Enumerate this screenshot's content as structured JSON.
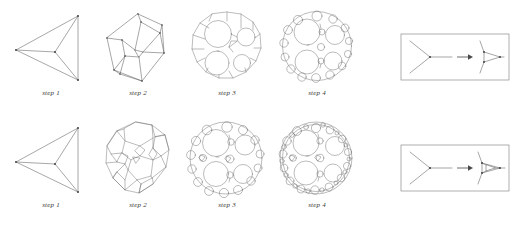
{
  "document": {
    "title": "Polyhedron truncation sequence diagram",
    "background_color": "#ffffff",
    "line_color": "#5d5d5d",
    "caption_color": "#3a3a3a",
    "box_color": "#8c8c8c"
  },
  "rows": [
    {
      "name": "top-row",
      "rule_name": "vertex-truncation-rule",
      "steps": [
        {
          "caption": "step 1",
          "shape_name": "tetrahedron",
          "faces": 4,
          "vertices": 4,
          "edges": 6
        },
        {
          "caption": "step 2",
          "shape_name": "truncated-tetrahedron",
          "faces": 8,
          "vertices": 12,
          "edges": 18
        },
        {
          "caption": "step 3",
          "shape_name": "twice-truncated-tetrahedron",
          "faces": 20,
          "vertices": 36,
          "edges": 54
        },
        {
          "caption": "step 4",
          "shape_name": "thrice-truncated-tetrahedron-sphere",
          "faces": 56,
          "vertices": 108,
          "edges": 162
        }
      ]
    },
    {
      "name": "bottom-row",
      "rule_name": "vertex-subdivision-rule",
      "steps": [
        {
          "caption": "step 1",
          "shape_name": "tetrahedron",
          "faces": 4,
          "vertices": 4,
          "edges": 6
        },
        {
          "caption": "step 2",
          "shape_name": "rhombitruncated-tetrahedron",
          "faces": 14,
          "vertices": 24,
          "edges": 36
        },
        {
          "caption": "step 3",
          "shape_name": "twice-subdivided-tetrahedron",
          "faces": 38,
          "vertices": 72,
          "edges": 108
        },
        {
          "caption": "step 4",
          "shape_name": "thrice-subdivided-tetrahedron-sphere",
          "faces": 110,
          "vertices": 216,
          "edges": 324
        }
      ]
    }
  ],
  "rule_boxes": [
    {
      "name": "rule-box-top",
      "left_label": "vertex",
      "right_label": "triangle-face",
      "arrow": "right-arrow"
    },
    {
      "name": "rule-box-bottom",
      "left_label": "vertex",
      "right_label": "subdivided-triangle-face",
      "arrow": "right-arrow"
    }
  ]
}
